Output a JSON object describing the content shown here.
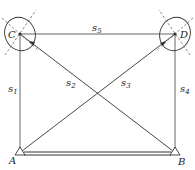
{
  "diagram": {
    "points": {
      "A": {
        "label": "A",
        "x": 20,
        "y": 153
      },
      "B": {
        "label": "B",
        "x": 175,
        "y": 153
      },
      "C": {
        "label": "C",
        "x": 20,
        "y": 34
      },
      "D": {
        "label": "D",
        "x": 175,
        "y": 34
      }
    },
    "edges": [
      {
        "id": "s1",
        "label": "s",
        "sub": "1",
        "from": "A",
        "to": "C"
      },
      {
        "id": "s2",
        "label": "s",
        "sub": "2",
        "from": "C",
        "to": "B"
      },
      {
        "id": "s3",
        "label": "s",
        "sub": "3",
        "from": "A",
        "to": "D"
      },
      {
        "id": "s4",
        "label": "s",
        "sub": "4",
        "from": "B",
        "to": "D"
      },
      {
        "id": "s5",
        "label": "s",
        "sub": "5",
        "from": "C",
        "to": "D"
      }
    ],
    "baseline": {
      "from": "A",
      "to": "B",
      "style": "double"
    },
    "error_ellipses": [
      "C",
      "D"
    ],
    "colors": {
      "line": "#333333",
      "background": "#ffffff"
    }
  }
}
